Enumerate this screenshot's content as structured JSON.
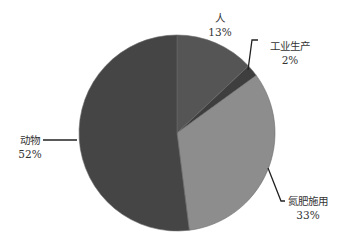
{
  "chart_data": {
    "type": "pie",
    "title": "",
    "start": "12 o'clock",
    "direction": "clockwise",
    "slices": [
      {
        "name": "人",
        "value": 13,
        "label": "13%",
        "color": "#555555"
      },
      {
        "name": "工业生产",
        "value": 2,
        "label": "2%",
        "color": "#3e3e3e"
      },
      {
        "name": "氮肥施用",
        "value": 33,
        "label": "33%",
        "color": "#8d8d8d"
      },
      {
        "name": "动物",
        "value": 52,
        "label": "52%",
        "color": "#454545"
      }
    ],
    "legend": "none",
    "data_labels": "outside with leader lines"
  }
}
